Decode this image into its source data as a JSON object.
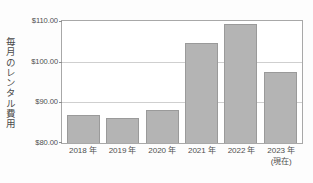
{
  "chart_data": {
    "type": "bar",
    "title": "",
    "subtitle": "",
    "xlabel": "",
    "ylabel": "毎月のレンタル費用",
    "categories": [
      "2018 年",
      "2019 年",
      "2020 年",
      "2021 年",
      "2022 年",
      "2023 年"
    ],
    "category_sublabels": [
      "",
      "",
      "",
      "",
      "",
      "(現在)"
    ],
    "values": [
      86.9,
      86.2,
      88.0,
      104.5,
      109.3,
      97.5
    ],
    "ylim": [
      80,
      110
    ],
    "yticks": [
      80,
      90,
      100,
      110
    ],
    "ytick_labels": [
      "$80.00",
      "$90.00",
      "$100.00",
      "$110.00"
    ],
    "grid": true,
    "legend": false,
    "legend_position": "none",
    "bar_color": "#b4b4b4",
    "bar_border_color": "#9a9a9a",
    "gridline_color": "#cfcfcf",
    "axis_color": "#a8a8a8",
    "background_color": "#ffffff",
    "text_color": "#4f4f4f",
    "currency": "$",
    "value_format": "$0.00"
  }
}
